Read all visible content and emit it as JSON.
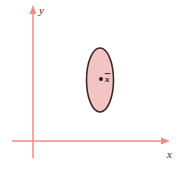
{
  "figure": {
    "background_color": "#ffffff"
  },
  "axes": {
    "color": "#f08a86",
    "x_axis": {
      "label": "x",
      "label_style": "italic",
      "origin_x": 33,
      "start_x": 12,
      "end_x": 168,
      "y": 141,
      "arrow": "right"
    },
    "y_axis": {
      "label": "y",
      "label_style": "italic",
      "x": 33,
      "top_y": 8,
      "bottom_y": 158,
      "arrow": "up"
    }
  },
  "ellipse": {
    "center_x": 100,
    "center_y": 80,
    "radius_x": 13.5,
    "radius_y": 32,
    "fill_color": "#f3c4c1",
    "stroke_color": "#3a2a28",
    "stroke_width": 1.6
  },
  "mean_point": {
    "label": "x",
    "overbar": true,
    "label_display": "x̄",
    "dot_x": 101,
    "dot_y": 79,
    "dot_radius": 1.9,
    "dot_color": "#1a1414",
    "label_x": 105,
    "label_y": 82
  }
}
